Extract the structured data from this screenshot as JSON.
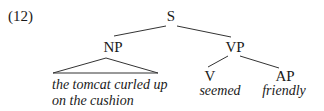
{
  "example_number": "(12)",
  "tree": {
    "root": "S",
    "np": {
      "label": "NP",
      "text_line1": "the tomcat curled up",
      "text_line2": "on the cushion"
    },
    "vp": {
      "label": "VP",
      "v": {
        "label": "V",
        "word": "seemed"
      },
      "ap": {
        "label": "AP",
        "word": "friendly"
      }
    }
  }
}
